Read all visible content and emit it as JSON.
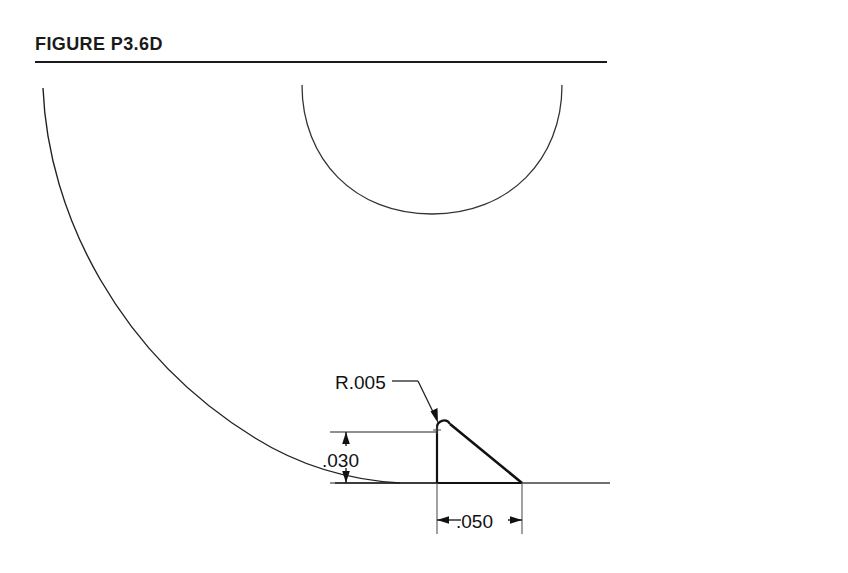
{
  "figure": {
    "title": "FIGURE P3.6D",
    "rule_color": "#1a1a1a"
  },
  "drawing": {
    "line_color": "#111111",
    "thin_line_color": "#333333",
    "annotations": {
      "radius_label": "R.005",
      "height_label": ".030",
      "width_label": ".050"
    },
    "geometry": {
      "baseline_y": 483,
      "apex_x": 437,
      "apex_y": 423,
      "right_vertex_x": 522,
      "right_vertex_y": 483,
      "height_dim_x": 346,
      "width_dim_y": 520,
      "large_arc_start": "43,88",
      "large_arc_end": "400,483",
      "upper_arc_left": "302,85",
      "upper_arc_right": "562,85",
      "upper_arc_bottom_y": 214
    }
  }
}
